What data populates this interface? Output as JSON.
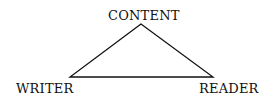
{
  "diagram": {
    "type": "triangle",
    "nodes": [
      {
        "id": "content",
        "label": "CONTENT",
        "position": "top"
      },
      {
        "id": "writer",
        "label": "WRITER",
        "position": "bottom-left"
      },
      {
        "id": "reader",
        "label": "READER",
        "position": "bottom-right"
      }
    ],
    "edges": [
      {
        "from": "content",
        "to": "writer"
      },
      {
        "from": "content",
        "to": "reader"
      },
      {
        "from": "writer",
        "to": "reader"
      }
    ],
    "line_color": "#111111"
  }
}
